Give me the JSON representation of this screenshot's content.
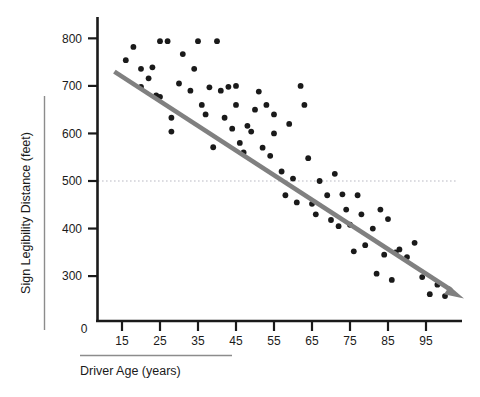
{
  "chart_data": {
    "type": "scatter",
    "title": "",
    "xlabel": "Driver Age (years)",
    "ylabel": "Sign Legibility Distance (feet)",
    "xlim": [
      10,
      106
    ],
    "ylim": [
      220,
      830
    ],
    "xticks": [
      15,
      25,
      35,
      45,
      55,
      65,
      75,
      85,
      95
    ],
    "yticks": [
      300,
      400,
      500,
      600,
      700,
      800
    ],
    "zero_label": "0",
    "grid": false,
    "legend": "none",
    "colors": {
      "point": "#1a1a1a",
      "trend_line": "#808080",
      "reference_line": "#b9b9c4",
      "axis": "#1a1a1a",
      "label_rule": "#8c8c8c",
      "background": "#ffffff"
    },
    "reference_line": {
      "orientation": "horizontal",
      "value": 500,
      "style": "dotted"
    },
    "trend_line": {
      "style": "solid-with-arrow",
      "x_start": 13,
      "y_start": 730,
      "x_end": 105,
      "y_end": 253
    },
    "points": [
      [
        16,
        754
      ],
      [
        18,
        782
      ],
      [
        20,
        736
      ],
      [
        20,
        698
      ],
      [
        22,
        716
      ],
      [
        23,
        739
      ],
      [
        24,
        680
      ],
      [
        25,
        677
      ],
      [
        25,
        794
      ],
      [
        27,
        794
      ],
      [
        28,
        633
      ],
      [
        28,
        604
      ],
      [
        30,
        705
      ],
      [
        31,
        767
      ],
      [
        33,
        690
      ],
      [
        34,
        736
      ],
      [
        35,
        794
      ],
      [
        36,
        660
      ],
      [
        37,
        640
      ],
      [
        38,
        697
      ],
      [
        39,
        571
      ],
      [
        40,
        794
      ],
      [
        41,
        690
      ],
      [
        42,
        633
      ],
      [
        43,
        698
      ],
      [
        44,
        610
      ],
      [
        45,
        700
      ],
      [
        45,
        660
      ],
      [
        46,
        580
      ],
      [
        47,
        560
      ],
      [
        48,
        616
      ],
      [
        49,
        604
      ],
      [
        50,
        650
      ],
      [
        51,
        688
      ],
      [
        52,
        570
      ],
      [
        53,
        660
      ],
      [
        54,
        553
      ],
      [
        55,
        600
      ],
      [
        55,
        640
      ],
      [
        57,
        520
      ],
      [
        58,
        470
      ],
      [
        59,
        620
      ],
      [
        60,
        505
      ],
      [
        61,
        455
      ],
      [
        62,
        700
      ],
      [
        63,
        660
      ],
      [
        64,
        548
      ],
      [
        65,
        452
      ],
      [
        66,
        430
      ],
      [
        67,
        500
      ],
      [
        69,
        470
      ],
      [
        70,
        418
      ],
      [
        71,
        515
      ],
      [
        72,
        405
      ],
      [
        73,
        472
      ],
      [
        74,
        440
      ],
      [
        75,
        408
      ],
      [
        76,
        352
      ],
      [
        77,
        470
      ],
      [
        78,
        430
      ],
      [
        79,
        365
      ],
      [
        81,
        400
      ],
      [
        82,
        305
      ],
      [
        83,
        440
      ],
      [
        84,
        345
      ],
      [
        85,
        420
      ],
      [
        86,
        292
      ],
      [
        87,
        350
      ],
      [
        88,
        356
      ],
      [
        90,
        340
      ],
      [
        92,
        370
      ],
      [
        94,
        298
      ],
      [
        96,
        262
      ],
      [
        98,
        282
      ],
      [
        100,
        258
      ]
    ]
  }
}
